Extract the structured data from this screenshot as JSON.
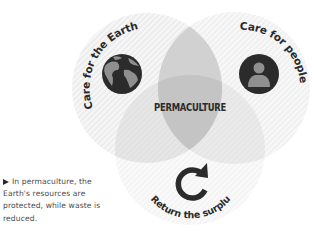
{
  "diagram": {
    "type": "venn",
    "center_label": "PERMACULTURE",
    "circles": [
      {
        "id": "earth",
        "label": "Care for the Earth",
        "icon": "globe-icon",
        "center": [
          147,
          88
        ],
        "radius": 75
      },
      {
        "id": "people",
        "label": "Care for people",
        "icon": "person-icon",
        "center": [
          234,
          88
        ],
        "radius": 76
      },
      {
        "id": "surplus",
        "label": "Return the surplus",
        "icon": "refresh-icon",
        "center": [
          190,
          150
        ],
        "radius": 75
      }
    ],
    "colors": {
      "circle_fill": "#e9e9e9",
      "stripe": "#ffffff",
      "overlap_fill": "#c9c9c9",
      "icon_dark": "#2b2b2b",
      "icon_light": "#8f8f8f",
      "text": "#2a2a2a"
    }
  },
  "caption": {
    "bullet": "triangle-right-icon",
    "text": "In permaculture, the Earth's resources are protected, while waste is reduced."
  }
}
